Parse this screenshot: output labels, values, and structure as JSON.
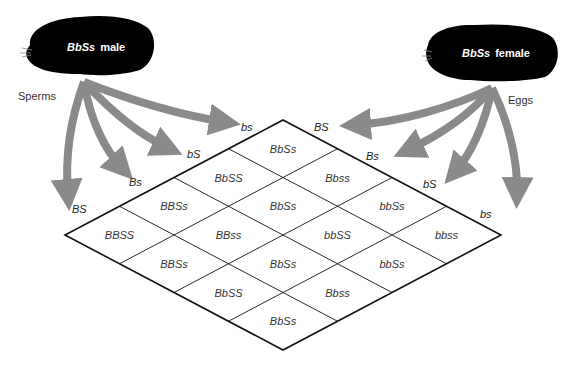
{
  "male": {
    "label_geno": "BbSs",
    "label_sex": "male",
    "gamete_label": "Sperms"
  },
  "female": {
    "label_geno": "BbSs",
    "label_sex": "female",
    "gamete_label": "Eggs"
  },
  "sperm_gametes": [
    "BS",
    "Bs",
    "bS",
    "bs"
  ],
  "egg_gametes": [
    "BS",
    "Bs",
    "bS",
    "bs"
  ],
  "grid": [
    [
      "BBSS",
      "BBSs",
      "BbSS",
      "BbSs"
    ],
    [
      "BBSs",
      "BBss",
      "BbSs",
      "Bbss"
    ],
    [
      "BbSS",
      "BbSs",
      "bbSS",
      "bbSs"
    ],
    [
      "BbSs",
      "Bbss",
      "bbSs",
      "bbss"
    ]
  ],
  "colors": {
    "arrow": "#8a8a8a",
    "animal": "#000000",
    "line": "#111111"
  }
}
